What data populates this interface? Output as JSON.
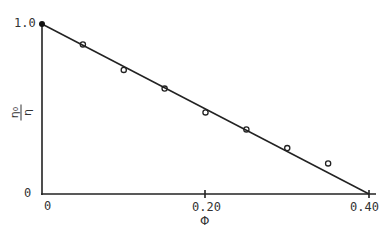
{
  "chart_data": {
    "type": "scatter",
    "title": "",
    "xlabel": "Φ",
    "ylabel": "η₀/η",
    "xlim": [
      0,
      0.4
    ],
    "ylim": [
      0,
      1.0
    ],
    "x_ticks": [
      "0",
      "0.20",
      "0.40"
    ],
    "y_ticks": [
      "0",
      "1.0"
    ],
    "grid": false,
    "legend": null,
    "series": [
      {
        "name": "data",
        "marker": "open-circle",
        "x": [
          0.05,
          0.1,
          0.15,
          0.2,
          0.25,
          0.3,
          0.35
        ],
        "y": [
          0.88,
          0.73,
          0.62,
          0.48,
          0.38,
          0.27,
          0.18
        ]
      },
      {
        "name": "linear fit",
        "marker": "line",
        "x": [
          0,
          0.4
        ],
        "y": [
          1.0,
          0
        ]
      }
    ]
  },
  "labels": {
    "y_top": "1.0",
    "y_bottom": "0",
    "x_left": "0",
    "x_mid": "0.20",
    "x_right": "0.40",
    "x_axis_title": "Φ",
    "y_axis_num": "η₀",
    "y_axis_den": "η"
  }
}
